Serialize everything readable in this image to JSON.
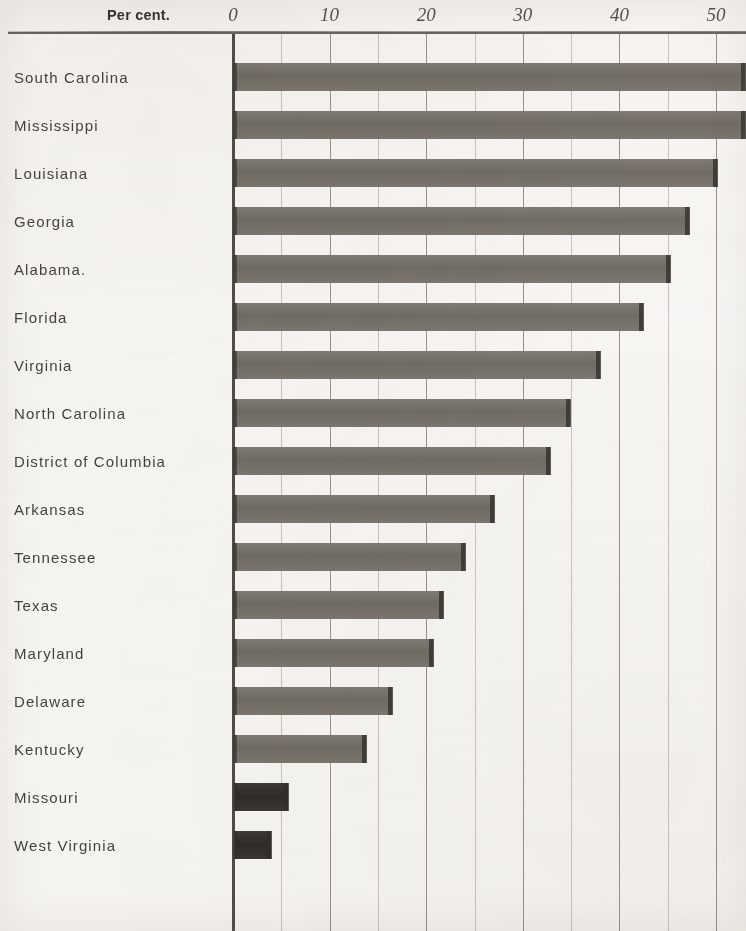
{
  "chart_data": {
    "type": "bar",
    "orientation": "horizontal",
    "title": "",
    "xlabel": "Per cent.",
    "ylabel": "",
    "xlim": [
      0,
      53
    ],
    "xticks": [
      0,
      10,
      20,
      30,
      40,
      50
    ],
    "xtick_labels": [
      "0",
      "10",
      "20",
      "30",
      "40",
      "50"
    ],
    "minor_tick_step": 5,
    "grid": "vertical",
    "legend": "none",
    "clipped_at_right_edge": [
      "South Carolina",
      "Mississippi"
    ],
    "categories": [
      "South Carolina",
      "Mississippi",
      "Louisiana",
      "Georgia",
      "Alabama",
      "Florida",
      "Virginia",
      "North Carolina",
      "District of Columbia",
      "Arkansas",
      "Tennessee",
      "Texas",
      "Maryland",
      "Delaware",
      "Kentucky",
      "Missouri",
      "West Virginia"
    ],
    "values": [
      53.0,
      53.0,
      50.1,
      47.2,
      45.2,
      42.4,
      38.0,
      34.9,
      32.8,
      27.0,
      24.0,
      21.7,
      20.7,
      16.5,
      13.8,
      5.7,
      3.9
    ]
  },
  "axis": {
    "caption": "Per cent.",
    "labels": [
      {
        "text": "0",
        "value": 0
      },
      {
        "text": "10",
        "value": 10
      },
      {
        "text": "20",
        "value": 20
      },
      {
        "text": "30",
        "value": 30
      },
      {
        "text": "40",
        "value": 40
      },
      {
        "text": "50",
        "value": 50
      }
    ]
  },
  "rows": [
    {
      "label": "South Carolina",
      "value": 53.0
    },
    {
      "label": "Mississippi",
      "value": 53.0
    },
    {
      "label": "Louisiana",
      "value": 50.1
    },
    {
      "label": "Georgia",
      "value": 47.2
    },
    {
      "label": "Alabama.",
      "value": 45.2
    },
    {
      "label": "Florida",
      "value": 42.4
    },
    {
      "label": "Virginia",
      "value": 38.0
    },
    {
      "label": "North Carolina",
      "value": 34.9
    },
    {
      "label": "District of Columbia",
      "value": 32.8
    },
    {
      "label": "Arkansas",
      "value": 27.0
    },
    {
      "label": "Tennessee",
      "value": 24.0
    },
    {
      "label": "Texas",
      "value": 21.7
    },
    {
      "label": "Maryland",
      "value": 20.7
    },
    {
      "label": "Delaware",
      "value": 16.5
    },
    {
      "label": "Kentucky",
      "value": 13.8
    },
    {
      "label": "Missouri",
      "value": 5.7
    },
    {
      "label": "West Virginia",
      "value": 3.9
    }
  ],
  "style": {
    "bar_color": "#726d66",
    "bar_edge_color": "#2e2b27",
    "grid_color": "#b9b4ac",
    "axis_color": "#3f3c37",
    "text_color": "#35322e",
    "paper_color": "#fbfaf8"
  }
}
